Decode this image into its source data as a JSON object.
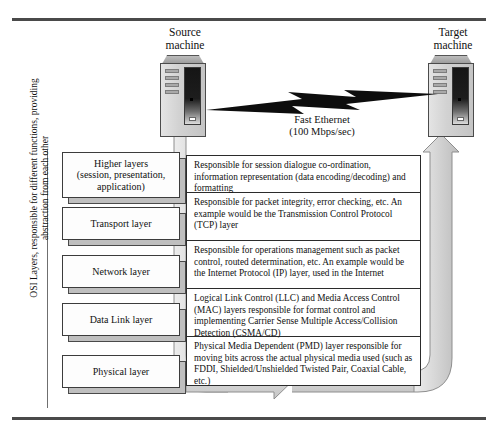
{
  "diagram": {
    "title_source": "Source\nmachine",
    "nodes": {
      "source": {
        "label_line1": "Source",
        "label_line2": "machine",
        "icon": "computer-tower-icon"
      },
      "target": {
        "label_line1": "Target",
        "label_line2": "machine",
        "icon": "computer-tower-icon"
      }
    },
    "link": {
      "icon": "lightning-bolt-icon",
      "label_line1": "Fast Ethernet",
      "label_line2": "(100 Mbps/sec)"
    },
    "axis_caption": "OSI Layers, responsible for different functions, providing abstraction from each other",
    "layers": [
      {
        "id": "higher",
        "lines": [
          "Higher layers",
          "(session, presentation,",
          "application)"
        ]
      },
      {
        "id": "transport",
        "lines": [
          "Transport layer"
        ]
      },
      {
        "id": "network",
        "lines": [
          "Network layer"
        ]
      },
      {
        "id": "datalink",
        "lines": [
          "Data Link layer"
        ]
      },
      {
        "id": "physical",
        "lines": [
          "Physical layer"
        ]
      }
    ],
    "descriptions": [
      {
        "id": "higher",
        "text": "Responsible for session dialogue co-ordination, information representation (data encoding/decoding) and formatting"
      },
      {
        "id": "transport",
        "text": "Responsible for packet integrity, error checking, etc. An example would be the Transmission Control Protocol (TCP) layer"
      },
      {
        "id": "network",
        "text": "Responsible for operations management such as packet control, routed determination, etc. An example would be the Internet Protocol (IP) layer, used in the Internet"
      },
      {
        "id": "datalink",
        "text": "Logical Link Control (LLC) and Media Access Control (MAC) layers responsible for format control and implementing Carrier Sense Multiple Access/Collision Detection (CSMA/CD)"
      },
      {
        "id": "physical",
        "text": "Physical Media Dependent (PMD) layer responsible for moving bits across the actual physical media used (such as FDDI, Shielded/Unshielded Twisted Pair, Coaxial Cable, etc.)"
      }
    ],
    "flow": {
      "down_pipe": "descending-stack-pipe",
      "bottom_arrow": "rightward-flow-arrow",
      "up_pipe": "ascending-stack-pipe"
    },
    "colors": {
      "rule": "#4a4a4a",
      "pipe_fill": "#d6d6d6",
      "pipe_stroke": "#8a8a8a",
      "box_face": "#fdfdfd",
      "box_shadow": "#bfbfbf",
      "text": "#111111"
    }
  }
}
